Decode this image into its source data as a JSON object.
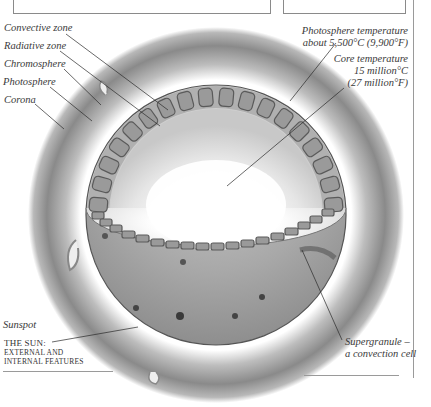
{
  "figure": {
    "caption_line1": "The sun:",
    "caption_line2": "external and",
    "caption_line3": "internal features"
  },
  "labels": {
    "left": [
      {
        "id": "convective-zone",
        "text": "Convective zone"
      },
      {
        "id": "radiative-zone",
        "text": "Radiative zone"
      },
      {
        "id": "chromosphere",
        "text": "Chromosphere"
      },
      {
        "id": "photosphere",
        "text": "Photosphere"
      },
      {
        "id": "corona",
        "text": "Corona"
      },
      {
        "id": "sunspot",
        "text": "Sunspot"
      }
    ],
    "right": [
      {
        "id": "photosphere-temperature",
        "line1": "Photosphere temperature",
        "line2": "about 5,500°C (9,900°F)"
      },
      {
        "id": "core-temperature",
        "line1": "Core temperature",
        "line2": "15 million°C",
        "line3": "(27 million°F)"
      },
      {
        "id": "supergranule",
        "line1": "Supergranule –",
        "line2": "a convection cell"
      }
    ]
  },
  "colors": {
    "halo": "#8c8c8c",
    "surface": "#a9a9a9",
    "cells": "#6e6e6e",
    "leader_lines": "#2a2a2a",
    "rules": "#9a9a9a"
  }
}
